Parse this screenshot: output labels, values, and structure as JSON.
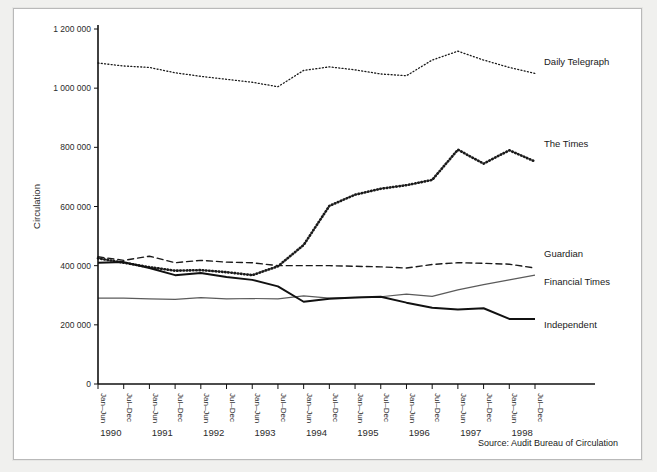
{
  "chart_data": {
    "type": "line",
    "title": "",
    "xlabel": "",
    "ylabel": "Circulation",
    "ylim": [
      0,
      1200000
    ],
    "ytick_labels": [
      "0",
      "200 000",
      "400 000",
      "600 000",
      "800 000",
      "1 000 000",
      "1 200 000"
    ],
    "ytick_values": [
      0,
      200000,
      400000,
      600000,
      800000,
      1000000,
      1200000
    ],
    "grid": false,
    "legend_position": "right-inline-labels",
    "source": "Source: Audit Bureau of Circulation",
    "categories": [
      "Jan–Jun",
      "Jul–Dec",
      "Jan–Jun",
      "Jul–Dec",
      "Jan–Jun",
      "Jul–Dec",
      "Jan–Jun",
      "Jul–Dec",
      "Jan–Jun",
      "Jul–Dec",
      "Jan–Jun",
      "Jul–Dec",
      "Jan–Jun",
      "Jul–Dec",
      "Jan–Jun",
      "Jul–Dec",
      "Jan–Jun",
      "Jul–Dec"
    ],
    "year_groups": [
      {
        "year": "1990",
        "start_index": 0,
        "span": 2
      },
      {
        "year": "1991",
        "start_index": 2,
        "span": 2
      },
      {
        "year": "1992",
        "start_index": 4,
        "span": 2
      },
      {
        "year": "1993",
        "start_index": 6,
        "span": 2
      },
      {
        "year": "1994",
        "start_index": 8,
        "span": 2
      },
      {
        "year": "1995",
        "start_index": 10,
        "span": 2
      },
      {
        "year": "1996",
        "start_index": 12,
        "span": 2
      },
      {
        "year": "1997",
        "start_index": 14,
        "span": 2
      },
      {
        "year": "1998",
        "start_index": 16,
        "span": 2
      }
    ],
    "series": [
      {
        "name": "Daily Telegraph",
        "style": "dotted-thin",
        "color": "#1a1a1a",
        "width": 1.3,
        "dash": "1,2.3",
        "label_y": 1090000,
        "values": [
          1085000,
          1075000,
          1070000,
          1052000,
          1040000,
          1030000,
          1020000,
          1005000,
          1060000,
          1072000,
          1062000,
          1048000,
          1042000,
          1095000,
          1125000,
          1095000,
          1070000,
          1050000
        ]
      },
      {
        "name": "The Times",
        "style": "dotted-bold",
        "color": "#1a1a1a",
        "width": 2.6,
        "dash": "0.6,2.6",
        "label_y": 812000,
        "values": [
          425000,
          410000,
          395000,
          383000,
          385000,
          378000,
          368000,
          398000,
          470000,
          602000,
          640000,
          660000,
          672000,
          690000,
          792000,
          745000,
          790000,
          752000
        ]
      },
      {
        "name": "Guardian",
        "style": "dashed",
        "color": "#1a1a1a",
        "width": 1.4,
        "dash": "6,4",
        "label_y": 438000,
        "values": [
          430000,
          418000,
          432000,
          410000,
          418000,
          412000,
          410000,
          400000,
          400000,
          400000,
          398000,
          396000,
          392000,
          404000,
          410000,
          408000,
          405000,
          392000
        ]
      },
      {
        "name": "Financial Times",
        "style": "solid-thin",
        "color": "#5b5b5b",
        "width": 1.2,
        "dash": "",
        "label_y": 345000,
        "values": [
          290000,
          290000,
          288000,
          286000,
          292000,
          288000,
          289000,
          288000,
          298000,
          290000,
          292000,
          295000,
          304000,
          296000,
          318000,
          336000,
          352000,
          368000
        ]
      },
      {
        "name": "Independent",
        "style": "solid-bold",
        "color": "#111111",
        "width": 2.0,
        "label_y": 198000,
        "dash": "",
        "values": [
          410000,
          412000,
          392000,
          368000,
          375000,
          362000,
          352000,
          330000,
          278000,
          288000,
          292000,
          295000,
          275000,
          258000,
          252000,
          256000,
          220000,
          220000
        ]
      }
    ]
  },
  "axis": {
    "y_title": "Circulation"
  },
  "footer": {
    "source": "Source: Audit Bureau of Circulation"
  }
}
